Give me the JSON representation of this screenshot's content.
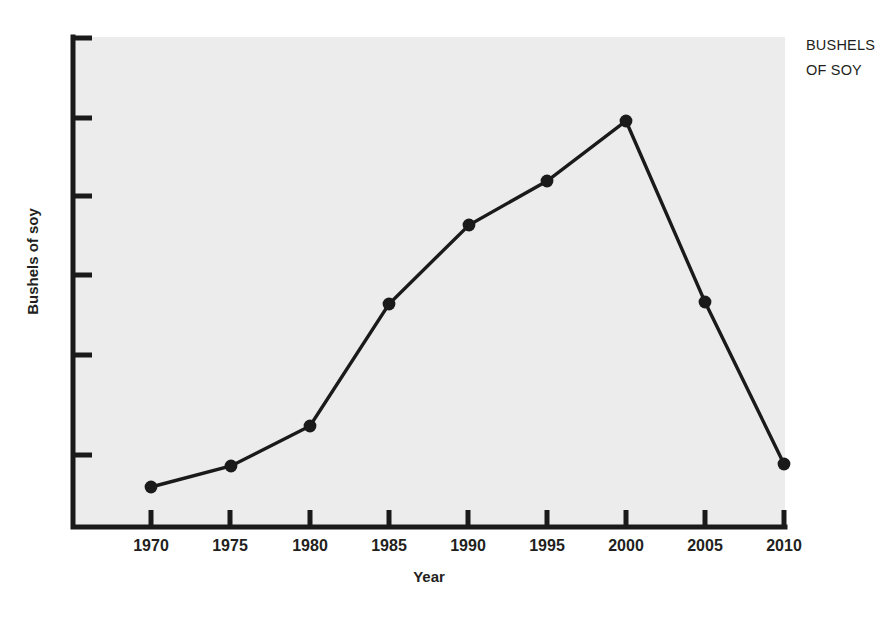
{
  "chart_data": {
    "type": "line",
    "title": "",
    "subtitle": "",
    "xlabel": "Year",
    "ylabel": "Bushels of soy",
    "annotation": "BUSHELS OF SOY",
    "annotation_lines": [
      "BUSHELS",
      "OF SOY"
    ],
    "categories": [
      "1970",
      "1975",
      "1980",
      "1985",
      "1990",
      "1995",
      "2000",
      "2005",
      "2010"
    ],
    "x": [
      1970,
      1975,
      1980,
      1985,
      1990,
      1995,
      2000,
      2005,
      2010
    ],
    "values": [
      8,
      12,
      20,
      45,
      61,
      70,
      82,
      45,
      13
    ],
    "series": [
      {
        "name": "Bushels of soy",
        "values": [
          8,
          12,
          20,
          45,
          61,
          70,
          82,
          45,
          13
        ],
        "color": "#1a1a1a",
        "marker": "circle",
        "marker_color": "#1a1a1a"
      }
    ],
    "xlim": [
      1970,
      2010
    ],
    "ylim": [
      0,
      100
    ],
    "x_tick_labels": [
      "1970",
      "1975",
      "1980",
      "1985",
      "1990",
      "1995",
      "2000",
      "2005",
      "2010"
    ],
    "y_tick_labels": [
      "",
      "",
      "",
      "",
      "",
      "",
      ""
    ],
    "y_ticks_unlabeled": true,
    "y_tick_count": 7,
    "grid": false,
    "legend": false,
    "legend_position": "none",
    "plot_background": "#ececec",
    "page_background": "#ffffff",
    "axis_color": "#1a1a1a",
    "spines": [
      "left",
      "bottom"
    ]
  },
  "axis": {
    "x_title": "Year",
    "y_title": "Bushels of soy"
  },
  "annotation": {
    "line1": "BUSHELS",
    "line2": "OF SOY"
  },
  "ticks": {
    "x": [
      {
        "label": "1970",
        "px": 151
      },
      {
        "label": "1975",
        "px": 230
      },
      {
        "label": "1980",
        "px": 310
      },
      {
        "label": "1985",
        "px": 389
      },
      {
        "label": "1990",
        "px": 468
      },
      {
        "label": "1995",
        "px": 547
      },
      {
        "label": "2000",
        "px": 626
      },
      {
        "label": "2005",
        "px": 705
      },
      {
        "label": "2010",
        "px": 784
      }
    ],
    "y_px": [
      38,
      118,
      196,
      275,
      355,
      455
    ]
  },
  "points": [
    {
      "label": "1970",
      "cx": 151,
      "cy": 487
    },
    {
      "label": "1975",
      "cx": 231,
      "cy": 466
    },
    {
      "label": "1980",
      "cx": 310,
      "cy": 426
    },
    {
      "label": "1985",
      "cx": 389,
      "cy": 304
    },
    {
      "label": "1990",
      "cx": 469,
      "cy": 225
    },
    {
      "label": "1995",
      "cx": 547,
      "cy": 181
    },
    {
      "label": "2000",
      "cx": 626,
      "cy": 121
    },
    {
      "label": "2005",
      "cx": 705,
      "cy": 302
    },
    {
      "label": "2010",
      "cx": 784,
      "cy": 464
    }
  ]
}
